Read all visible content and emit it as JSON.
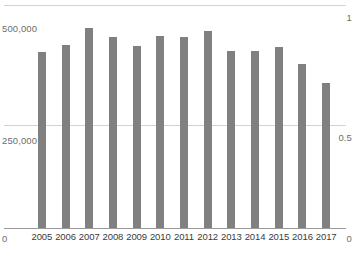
{
  "chart_data": {
    "type": "bar",
    "title": "",
    "subtitle": "",
    "xlabel": "",
    "ylabel": "",
    "categories": [
      "2005",
      "2006",
      "2007",
      "2008",
      "2009",
      "2010",
      "2011",
      "2012",
      "2013",
      "2014",
      "2015",
      "2016",
      "2017"
    ],
    "values": [
      394000,
      411000,
      448000,
      429000,
      409000,
      431000,
      429000,
      442000,
      396000,
      396000,
      406000,
      367000,
      325000
    ],
    "series": [
      {
        "name": "",
        "values": [
          394000,
          411000,
          448000,
          429000,
          409000,
          431000,
          429000,
          442000,
          396000,
          396000,
          406000,
          367000,
          325000
        ],
        "color": "#808080"
      }
    ],
    "ylim": [
      0,
      500000
    ],
    "y_ticks": [
      0,
      250000,
      500000
    ],
    "y_tick_labels_left": [
      "0",
      "250,000",
      "500,000"
    ],
    "secondary_ylim": [
      0,
      1
    ],
    "secondary_y_ticks": [
      0,
      0.5,
      1
    ],
    "y_tick_labels_right": [
      "0",
      "0.5",
      "1"
    ],
    "grid": true,
    "gridlines": [
      "500,000",
      "250,000"
    ],
    "legend": [],
    "legend_position": "none",
    "annotations": []
  },
  "axes": {
    "left": {
      "top_label": "500,000",
      "mid_label": "250,000",
      "bottom_label": "0"
    },
    "right": {
      "top_label": "1",
      "mid_label": "0.5",
      "bottom_label": "0"
    }
  },
  "colors": {
    "bar": "#808080",
    "gridline": "#d2d2d2",
    "axis": "#9a9a9a",
    "tick_text": "#6e6e6e",
    "category_text": "#3b3b3b",
    "background": "#ffffff"
  }
}
